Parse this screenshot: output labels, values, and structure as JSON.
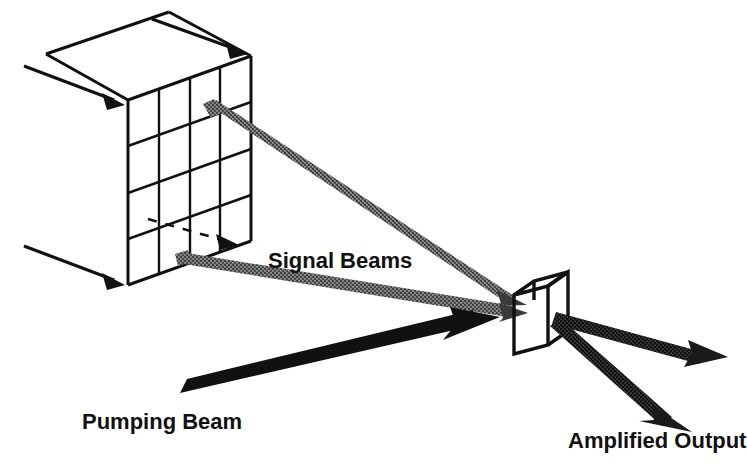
{
  "figure": {
    "background_color": "#ffffff",
    "width": 747,
    "height": 465
  },
  "labels": {
    "signal_beams": "Signal Beams",
    "pumping_beam": "Pumping Beam",
    "amplified_output": "Amplified Output"
  },
  "colors": {
    "ink": "#111111",
    "signal_gray": "#6a6a6a",
    "signal_gray_light": "#8a8a8a",
    "pump_black": "#111111",
    "output_black": "#1a1a1a",
    "background": "#ffffff"
  },
  "components": {
    "pixel_array": {
      "name": "pixel-array",
      "rows": 4,
      "columns": 4,
      "description": "Isometric wireframe box with 4 by 4 front-face grid"
    },
    "crystal": {
      "name": "nonlinear-crystal",
      "description": "Small wireframe rectangular box at beam convergence point"
    },
    "input_arrows": {
      "count": 3,
      "description": "Thin black arrows entering the pixel array from the left"
    },
    "dashed_ray": {
      "count": 1,
      "description": "Dashed arrow traversing the interior of the pixel array"
    },
    "signal_beams": {
      "count": 2,
      "description": "Gray textured beams leaving array pixels toward the crystal"
    },
    "pumping_beam": {
      "count": 1,
      "description": "Thick solid black arrow entering the crystal from lower left"
    },
    "output_beams": {
      "count": 2,
      "description": "Dark arrows exiting the crystal to the right and lower right"
    }
  }
}
